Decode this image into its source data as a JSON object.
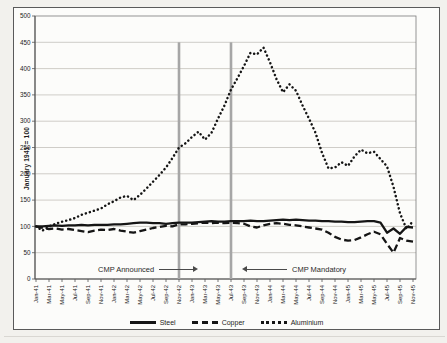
{
  "figure": {
    "background": "#fcfcfa",
    "border_color": "#5a5a5a",
    "gridline_color": "#c9c7c2",
    "axis_color": "#555555",
    "line_color": "#151515"
  },
  "chart_data": {
    "type": "line",
    "title": "",
    "xlabel": "",
    "ylabel": "January 1941 = 100",
    "ylim": [
      0,
      500
    ],
    "y_ticks": [
      0,
      50,
      100,
      150,
      200,
      250,
      300,
      350,
      400,
      450,
      500
    ],
    "x_tick_every": 2,
    "grid": "horizontal",
    "legend_position": "bottom",
    "categories": [
      "Jan-41",
      "Feb-41",
      "Mar-41",
      "Apr-41",
      "May-41",
      "Jun-41",
      "Jul-41",
      "Aug-41",
      "Sep-41",
      "Oct-41",
      "Nov-41",
      "Dec-41",
      "Jan-42",
      "Feb-42",
      "Mar-42",
      "Apr-42",
      "May-42",
      "Jun-42",
      "Jul-42",
      "Aug-42",
      "Sep-42",
      "Oct-42",
      "Nov-42",
      "Dec-42",
      "Jan-43",
      "Feb-43",
      "Mar-43",
      "Apr-43",
      "May-43",
      "Jun-43",
      "Jul-43",
      "Aug-43",
      "Sep-43",
      "Oct-43",
      "Nov-43",
      "Dec-43",
      "Jan-44",
      "Feb-44",
      "Mar-44",
      "Apr-44",
      "May-44",
      "Jun-44",
      "Jul-44",
      "Aug-44",
      "Sep-44",
      "Oct-44",
      "Nov-44",
      "Dec-44",
      "Jan-45",
      "Feb-45",
      "Mar-45",
      "Apr-45",
      "May-45",
      "Jun-45",
      "Jul-45",
      "Aug-45",
      "Sep-45",
      "Oct-45",
      "Nov-45"
    ],
    "series": [
      {
        "name": "Steel",
        "style": "solid",
        "color": "#151515",
        "values": [
          100,
          100,
          101,
          102,
          101,
          102,
          102,
          103,
          102,
          103,
          103,
          103,
          104,
          104,
          105,
          106,
          107,
          107,
          106,
          106,
          105,
          106,
          107,
          107,
          107,
          108,
          109,
          110,
          109,
          109,
          110,
          110,
          110,
          111,
          110,
          110,
          111,
          112,
          113,
          112,
          113,
          112,
          111,
          111,
          110,
          110,
          109,
          109,
          108,
          108,
          109,
          110,
          110,
          107,
          88,
          96,
          86,
          99,
          98
        ]
      },
      {
        "name": "Copper",
        "style": "dashed",
        "color": "#151515",
        "values": [
          100,
          97,
          95,
          96,
          94,
          95,
          93,
          91,
          89,
          92,
          94,
          93,
          95,
          92,
          90,
          88,
          91,
          94,
          97,
          99,
          101,
          100,
          104,
          104,
          105,
          106,
          107,
          106,
          107,
          106,
          107,
          106,
          105,
          100,
          98,
          102,
          105,
          106,
          105,
          103,
          102,
          100,
          98,
          96,
          94,
          88,
          80,
          75,
          73,
          74,
          79,
          85,
          90,
          85,
          67,
          50,
          78,
          73,
          71
        ]
      },
      {
        "name": "Aluminium",
        "style": "dotted",
        "color": "#151515",
        "values": [
          100,
          92,
          100,
          105,
          109,
          112,
          116,
          122,
          126,
          130,
          134,
          142,
          148,
          155,
          158,
          150,
          160,
          172,
          185,
          198,
          212,
          230,
          250,
          258,
          270,
          280,
          265,
          278,
          305,
          330,
          360,
          382,
          405,
          430,
          427,
          440,
          412,
          380,
          355,
          370,
          358,
          330,
          305,
          278,
          240,
          210,
          212,
          222,
          215,
          233,
          246,
          239,
          242,
          228,
          214,
          175,
          125,
          95,
          110
        ]
      }
    ],
    "reference_lines": [
      {
        "category": "Nov-42",
        "label": "CMP Announced",
        "color": "#a6a6a6",
        "top_value": 450
      },
      {
        "category": "Jul-43",
        "label": "CMP Mandatory",
        "color": "#a6a6a6",
        "top_value": 450
      }
    ],
    "annotations": [
      {
        "text": "CMP Announced",
        "arrow": "right"
      },
      {
        "text": "CMP Mandatory",
        "arrow": "left"
      }
    ]
  }
}
